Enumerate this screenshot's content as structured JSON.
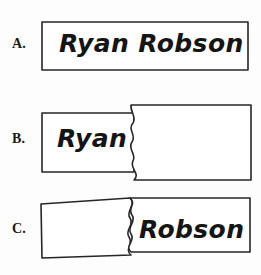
{
  "page": {
    "background_color": "#fdfdfd",
    "stroke_color": "#262626",
    "text_color": "#151515"
  },
  "items": [
    {
      "label": "A.",
      "name": "item-a",
      "description": "whole-name-card",
      "text": "Ryan Robson"
    },
    {
      "label": "B.",
      "name": "item-b",
      "description": "torn-card-first-name-left",
      "text": "Ryan"
    },
    {
      "label": "C.",
      "name": "item-c",
      "description": "torn-card-last-name-right",
      "text": "Robson"
    }
  ],
  "shapes": {
    "card_a": "M42,22 L248,22 L248,70 L42,70 Z",
    "card_b_left": "M42,113 L133,113 L133,172 L42,172 Z",
    "card_b_right": "M131,105 L251,105 L251,180 L133,180 C140,168 126,160 133,150 C140,140 126,132 132,122 C136,114 131,111 131,105 Z",
    "card_c_left": "M41,204 L131,199 L131,205 C125,212 139,219 132,229 C125,239 139,247 132,257 L42,259 Z",
    "card_c_right": "M130,199 L250,199 L250,252 L131,252 C138,242 124,234 131,224 C138,214 124,206 130,199 Z"
  }
}
